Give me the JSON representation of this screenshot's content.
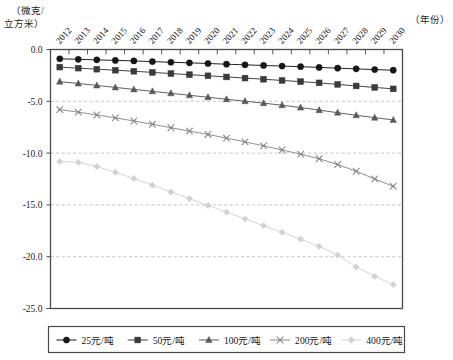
{
  "chart_data": {
    "type": "line",
    "title": "",
    "subtitle": "",
    "ylabel": "（微克/立方米）",
    "ylabel_line1": "（微克/",
    "ylabel_line2": "立方米）",
    "xlabel": "（年份）",
    "grid": true,
    "grid_orientation": "horizontal",
    "legend_position": "bottom",
    "ylim": [
      -25.0,
      0.0
    ],
    "yticks": [
      0.0,
      -5.0,
      -10.0,
      -15.0,
      -20.0,
      -25.0
    ],
    "ytick_labels": [
      "0.0",
      "-5.0",
      "-10.0",
      "-15.0",
      "-20.0",
      "-25.0"
    ],
    "categories": [
      "2012",
      "2013",
      "2014",
      "2015",
      "2016",
      "2017",
      "2018",
      "2019",
      "2020",
      "2021",
      "2022",
      "2023",
      "2024",
      "2025",
      "2026",
      "2027",
      "2028",
      "2029",
      "2030"
    ],
    "x": [
      2012,
      2013,
      2014,
      2015,
      2016,
      2017,
      2018,
      2019,
      2020,
      2021,
      2022,
      2023,
      2024,
      2025,
      2026,
      2027,
      2028,
      2029,
      2030
    ],
    "series": [
      {
        "name": "25元/吨",
        "marker": "circle",
        "color": "#161616",
        "values": [
          -0.9,
          -0.95,
          -1.0,
          -1.05,
          -1.1,
          -1.17,
          -1.23,
          -1.29,
          -1.35,
          -1.42,
          -1.48,
          -1.54,
          -1.6,
          -1.66,
          -1.73,
          -1.8,
          -1.87,
          -1.94,
          -2.0
        ]
      },
      {
        "name": "50元/吨",
        "marker": "square",
        "color": "#3a3a3a",
        "values": [
          -1.7,
          -1.8,
          -1.9,
          -2.0,
          -2.1,
          -2.21,
          -2.32,
          -2.43,
          -2.54,
          -2.65,
          -2.76,
          -2.87,
          -2.99,
          -3.1,
          -3.22,
          -3.37,
          -3.52,
          -3.66,
          -3.8
        ]
      },
      {
        "name": "100元/吨",
        "marker": "triangle",
        "color": "#595959",
        "values": [
          -3.1,
          -3.28,
          -3.47,
          -3.66,
          -3.85,
          -4.04,
          -4.23,
          -4.42,
          -4.61,
          -4.8,
          -4.99,
          -5.18,
          -5.38,
          -5.6,
          -5.85,
          -6.1,
          -6.35,
          -6.58,
          -6.8
        ]
      },
      {
        "name": "200元/吨",
        "marker": "cross",
        "color": "#8a8a8a",
        "values": [
          -5.8,
          -6.05,
          -6.32,
          -6.6,
          -6.9,
          -7.22,
          -7.55,
          -7.88,
          -8.2,
          -8.55,
          -8.92,
          -9.3,
          -9.7,
          -10.1,
          -10.55,
          -11.1,
          -11.75,
          -12.5,
          -13.2
        ]
      },
      {
        "name": "400元/吨",
        "marker": "diamond",
        "color": "#d2d2d2",
        "values": [
          -10.8,
          -10.9,
          -11.3,
          -11.85,
          -12.45,
          -13.1,
          -13.75,
          -14.4,
          -15.05,
          -15.7,
          -16.35,
          -17.0,
          -17.65,
          -18.3,
          -19.0,
          -19.85,
          -21.0,
          -21.9,
          -22.7
        ]
      }
    ]
  },
  "legend": {
    "items": [
      {
        "label": "25元/吨",
        "marker": "circle",
        "color": "#161616"
      },
      {
        "label": "50元/吨",
        "marker": "square",
        "color": "#3a3a3a"
      },
      {
        "label": "100元/吨",
        "marker": "triangle",
        "color": "#595959"
      },
      {
        "label": "200元/吨",
        "marker": "cross",
        "color": "#8a8a8a"
      },
      {
        "label": "400元/吨",
        "marker": "diamond",
        "color": "#d2d2d2"
      }
    ]
  },
  "style": {
    "frame_color": "#4a4a4a",
    "grid_color": "#b9b9b9",
    "background": "#ffffff"
  }
}
